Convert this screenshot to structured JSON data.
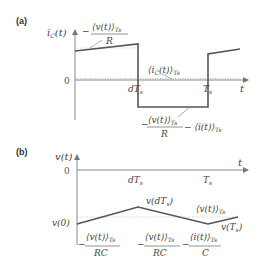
{
  "panel_a": {
    "label": "(a)",
    "y_axis_label": "i_C(t)",
    "x_axis_label": "t",
    "zero_label": "0",
    "tick_dTs": "dT_s",
    "tick_Ts": "T_s",
    "upper_expr": {
      "prefix": "−",
      "num": "⟨v(t)⟩",
      "sub": "Ts",
      "den": "R"
    },
    "avg_label": {
      "text": "⟨i_C(t)⟩",
      "sub": "Ts"
    },
    "lower_expr": {
      "prefix": "−",
      "num": "⟨v(t)⟩",
      "sub": "Ts",
      "den": "R",
      "suffix": "− ⟨i(t)⟩",
      "suffix_sub": "Ts"
    }
  },
  "panel_b": {
    "label": "(b)",
    "y_axis_label": "v(t)",
    "x_axis_label": "t",
    "zero_label": "0",
    "tick_dTs": "dT_s",
    "tick_Ts": "T_s",
    "v0_label": "v(0)",
    "vdTs_label": "v(dT_s)",
    "vTs_label": "v(T_s)",
    "avg_label": {
      "text": "⟨v(t)⟩",
      "sub": "Ts"
    },
    "slope1": {
      "prefix": "−",
      "num": "⟨v(t)⟩",
      "sub": "Ts",
      "den": "RC"
    },
    "slope2": {
      "prefix": "−",
      "num": "⟨v(t)⟩",
      "sub": "Ts",
      "den": "RC",
      "mid": "−",
      "num2": "⟨i(t)⟩",
      "sub2": "Ts",
      "den2": "C"
    }
  }
}
